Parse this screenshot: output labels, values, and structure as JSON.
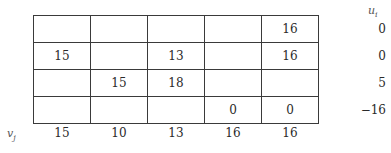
{
  "table": {
    "rows": [
      [
        "",
        "",
        "",
        "",
        "16"
      ],
      [
        "15",
        "",
        "13",
        "",
        "16"
      ],
      [
        "",
        "15",
        "18",
        "",
        ""
      ],
      [
        "",
        "",
        "",
        "0",
        "0"
      ]
    ]
  },
  "u": {
    "label": "u",
    "subscript": "i",
    "values": [
      "0",
      "0",
      "5",
      "−16"
    ]
  },
  "v": {
    "label": "v",
    "subscript": "j",
    "values": [
      "15",
      "10",
      "13",
      "16",
      "16"
    ]
  }
}
